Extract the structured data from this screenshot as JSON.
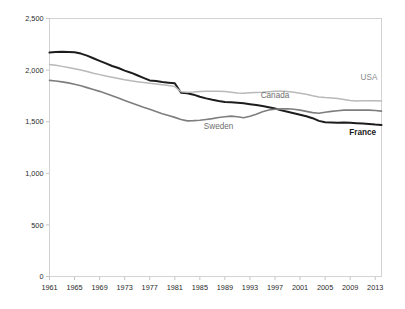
{
  "chart_data": {
    "type": "line",
    "title": "",
    "subtitle": "",
    "xlabel": "",
    "ylabel": "",
    "xlim": [
      1961,
      2014
    ],
    "ylim": [
      0,
      2500
    ],
    "grid": false,
    "legend_position": "inline-labels",
    "y_ticks": [
      "0",
      "500",
      "1,000",
      "1,500",
      "2,000",
      "2,500"
    ],
    "y_tick_values": [
      0,
      500,
      1000,
      1500,
      2000,
      2500
    ],
    "x_ticks": [
      "1961",
      "1965",
      "1969",
      "1973",
      "1977",
      "1981",
      "1985",
      "1989",
      "1993",
      "1997",
      "2001",
      "2005",
      "2009",
      "2013"
    ],
    "x_tick_values": [
      1961,
      1965,
      1969,
      1973,
      1977,
      1981,
      1985,
      1989,
      1993,
      1997,
      2001,
      2005,
      2009,
      2013
    ],
    "x": [
      1961,
      1962,
      1963,
      1964,
      1965,
      1966,
      1967,
      1968,
      1969,
      1970,
      1971,
      1972,
      1973,
      1974,
      1975,
      1976,
      1977,
      1978,
      1979,
      1980,
      1981,
      1982,
      1983,
      1984,
      1985,
      1986,
      1987,
      1988,
      1989,
      1990,
      1991,
      1992,
      1993,
      1994,
      1995,
      1996,
      1997,
      1998,
      1999,
      2000,
      2001,
      2002,
      2003,
      2004,
      2005,
      2006,
      2007,
      2008,
      2009,
      2010,
      2011,
      2012,
      2013,
      2014
    ],
    "series": [
      {
        "name": "France",
        "color": "#1c1c1c",
        "style": "thick-black",
        "label_x": 2011,
        "label_y": 1375,
        "values": [
          2170,
          2175,
          2178,
          2176,
          2172,
          2160,
          2140,
          2115,
          2090,
          2065,
          2040,
          2020,
          1995,
          1975,
          1950,
          1925,
          1900,
          1895,
          1885,
          1878,
          1872,
          1780,
          1775,
          1762,
          1742,
          1726,
          1712,
          1700,
          1692,
          1688,
          1684,
          1678,
          1670,
          1662,
          1652,
          1640,
          1628,
          1610,
          1596,
          1582,
          1568,
          1552,
          1534,
          1508,
          1494,
          1492,
          1490,
          1492,
          1490,
          1486,
          1482,
          1478,
          1472,
          1468
        ]
      },
      {
        "name": "USA",
        "color": "#b9b9b9",
        "style": "light-gray",
        "label_x": 2012,
        "label_y": 1905,
        "values": [
          2055,
          2046,
          2036,
          2026,
          2014,
          2000,
          1986,
          1970,
          1956,
          1942,
          1930,
          1918,
          1906,
          1896,
          1888,
          1880,
          1872,
          1866,
          1858,
          1850,
          1840,
          1790,
          1786,
          1788,
          1792,
          1794,
          1796,
          1794,
          1792,
          1786,
          1778,
          1776,
          1780,
          1784,
          1786,
          1790,
          1794,
          1796,
          1792,
          1786,
          1776,
          1766,
          1752,
          1740,
          1734,
          1730,
          1724,
          1716,
          1706,
          1700,
          1702,
          1704,
          1702,
          1700
        ]
      },
      {
        "name": "Canada",
        "color": "#7e7e7e",
        "style": "mid-gray",
        "label_x": 1997,
        "label_y": 1728,
        "second_label": "Sweden",
        "second_label_x": 1988,
        "second_label_y": 1430,
        "values": [
          1900,
          1894,
          1886,
          1876,
          1862,
          1848,
          1830,
          1812,
          1794,
          1774,
          1752,
          1730,
          1706,
          1684,
          1662,
          1640,
          1620,
          1598,
          1578,
          1560,
          1542,
          1522,
          1508,
          1510,
          1514,
          1522,
          1530,
          1540,
          1548,
          1554,
          1548,
          1538,
          1552,
          1572,
          1596,
          1614,
          1620,
          1624,
          1626,
          1620,
          1612,
          1600,
          1588,
          1582,
          1592,
          1600,
          1606,
          1612,
          1614,
          1612,
          1614,
          1612,
          1608,
          1602
        ]
      }
    ],
    "annotations": [
      {
        "text": "USA",
        "tone": "light"
      },
      {
        "text": "Canada",
        "tone": "mid"
      },
      {
        "text": "Sweden",
        "tone": "mid"
      },
      {
        "text": "France",
        "tone": "dark"
      }
    ]
  }
}
